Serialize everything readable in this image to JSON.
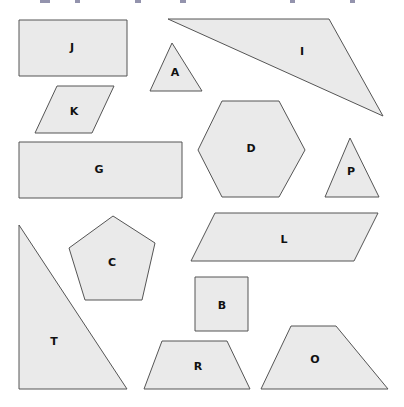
{
  "figure": {
    "background": "#ffffff",
    "fill_color": "#eaeaea",
    "stroke_color": "#555555",
    "shapes": [
      {
        "label": "J",
        "type": "rectangle",
        "points": "19,20 127,20 127,76 19,76",
        "label_pos": [
          72,
          51
        ]
      },
      {
        "label": "A",
        "type": "triangle",
        "points": "150,91 172,43 202,91",
        "label_pos": [
          175,
          76
        ]
      },
      {
        "label": "I",
        "type": "triangle",
        "points": "168,19 329,19 383,116",
        "label_pos": [
          302,
          55
        ]
      },
      {
        "label": "K",
        "type": "parallelogram",
        "points": "35,133 57,86 114,86 92,133",
        "label_pos": [
          74,
          115
        ]
      },
      {
        "label": "G",
        "type": "rectangle",
        "points": "19,142 182,142 182,198 19,198",
        "label_pos": [
          99,
          173
        ]
      },
      {
        "label": "D",
        "type": "hexagon",
        "points": "198,150 222,101 279,101 305,150 279,197 222,197",
        "label_pos": [
          251,
          152
        ]
      },
      {
        "label": "P",
        "type": "triangle",
        "points": "325,197 350,138 379,197",
        "label_pos": [
          351,
          175
        ]
      },
      {
        "label": "L",
        "type": "parallelogram",
        "points": "191,261 215,213 378,213 354,261",
        "label_pos": [
          284,
          243
        ]
      },
      {
        "label": "C",
        "type": "pentagon",
        "points": "113,216 155,243 142,300 85,300 69,248",
        "label_pos": [
          112,
          266
        ]
      },
      {
        "label": "T",
        "type": "right-triangle",
        "points": "19,225 19,389 127,389",
        "label_pos": [
          54,
          345
        ]
      },
      {
        "label": "B",
        "type": "square",
        "points": "195,277 248,277 248,331 195,331",
        "label_pos": [
          222,
          309
        ]
      },
      {
        "label": "R",
        "type": "trapezoid",
        "points": "144,389 162,341 227,341 250,389",
        "label_pos": [
          198,
          370
        ]
      },
      {
        "label": "O",
        "type": "trapezoid",
        "points": "261,389 291,326 336,326 388,389",
        "label_pos": [
          315,
          363
        ]
      }
    ]
  }
}
